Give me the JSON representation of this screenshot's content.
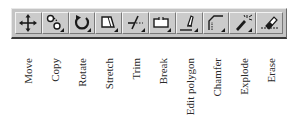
{
  "toolbar": {
    "buttons": [
      {
        "id": "move",
        "icon": "move-icon",
        "label": "Move"
      },
      {
        "id": "copy",
        "icon": "copy-icon",
        "label": "Copy"
      },
      {
        "id": "rotate",
        "icon": "rotate-icon",
        "label": "Rotate"
      },
      {
        "id": "stretch",
        "icon": "stretch-icon",
        "label": "Stretch"
      },
      {
        "id": "trim",
        "icon": "trim-icon",
        "label": "Trim"
      },
      {
        "id": "break",
        "icon": "break-icon",
        "label": "Break"
      },
      {
        "id": "edit-polygon",
        "icon": "edit-polygon-icon",
        "label": "Edit polygon"
      },
      {
        "id": "chamfer",
        "icon": "chamfer-icon",
        "label": "Chamfer"
      },
      {
        "id": "explode",
        "icon": "explode-icon",
        "label": "Explode"
      },
      {
        "id": "erase",
        "icon": "erase-icon",
        "label": "Erase"
      }
    ]
  },
  "colors": {
    "toolbar_bg": "#c4c4c4",
    "button_bg": "#cbcbcb",
    "icon": "#1a1a1a"
  }
}
